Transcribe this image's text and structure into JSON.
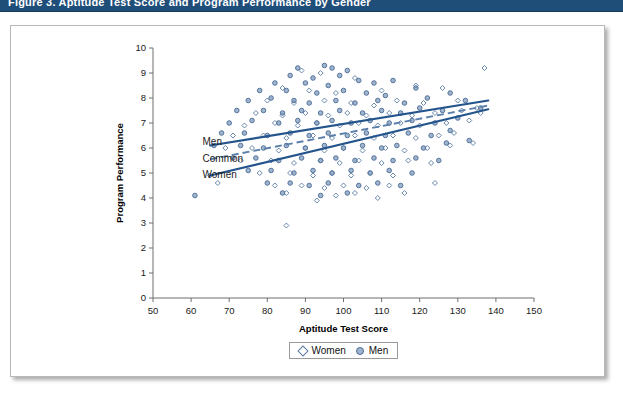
{
  "banner": {
    "title": "Figure 3. Aptitude Test Score and Program Performance by Gender"
  },
  "chart_data": {
    "type": "scatter",
    "title": "",
    "xlabel": "Aptitude Test Score",
    "ylabel": "Program Performance",
    "xlim": [
      50,
      150
    ],
    "ylim": [
      0,
      10
    ],
    "xticks": [
      50,
      60,
      70,
      80,
      90,
      100,
      110,
      120,
      130,
      140,
      150
    ],
    "yticks": [
      0,
      1,
      2,
      3,
      4,
      5,
      6,
      7,
      8,
      9,
      10
    ],
    "grid": false,
    "legend_position": "bottom-center",
    "legend": [
      "Women",
      "Men"
    ],
    "annotations": [
      {
        "text": "Men",
        "x": 63,
        "y": 6.25
      },
      {
        "text": "Common",
        "x": 63,
        "y": 5.6
      },
      {
        "text": "Women",
        "x": 63,
        "y": 4.95
      }
    ],
    "trendlines": [
      {
        "name": "Men",
        "style": "solid",
        "x": [
          65,
          138
        ],
        "y": [
          6.1,
          7.9
        ]
      },
      {
        "name": "Common",
        "style": "dashed",
        "x": [
          65,
          138
        ],
        "y": [
          5.55,
          7.7
        ]
      },
      {
        "name": "Women",
        "style": "solid",
        "x": [
          65,
          138
        ],
        "y": [
          4.9,
          7.55
        ]
      }
    ],
    "series": [
      {
        "name": "Men",
        "marker": "filled-circle",
        "color": "#4a6a95",
        "points": [
          [
            88,
            9.2
          ],
          [
            95,
            9.3
          ],
          [
            97,
            9.2
          ],
          [
            101,
            9.1
          ],
          [
            86,
            8.9
          ],
          [
            92,
            8.8
          ],
          [
            99,
            8.9
          ],
          [
            104,
            8.7
          ],
          [
            82,
            8.6
          ],
          [
            90,
            8.6
          ],
          [
            96,
            8.5
          ],
          [
            108,
            8.6
          ],
          [
            113,
            8.7
          ],
          [
            78,
            8.3
          ],
          [
            85,
            8.3
          ],
          [
            93,
            8.2
          ],
          [
            100,
            8.3
          ],
          [
            106,
            8.2
          ],
          [
            111,
            8.1
          ],
          [
            119,
            8.4
          ],
          [
            75,
            7.9
          ],
          [
            81,
            8.0
          ],
          [
            87,
            7.9
          ],
          [
            91,
            7.8
          ],
          [
            98,
            7.9
          ],
          [
            103,
            7.8
          ],
          [
            109,
            7.9
          ],
          [
            116,
            7.8
          ],
          [
            122,
            8.0
          ],
          [
            72,
            7.5
          ],
          [
            79,
            7.5
          ],
          [
            84,
            7.4
          ],
          [
            89,
            7.5
          ],
          [
            94,
            7.4
          ],
          [
            99,
            7.5
          ],
          [
            105,
            7.4
          ],
          [
            110,
            7.5
          ],
          [
            115,
            7.4
          ],
          [
            120,
            7.6
          ],
          [
            126,
            7.5
          ],
          [
            70,
            7.0
          ],
          [
            76,
            7.1
          ],
          [
            83,
            7.0
          ],
          [
            88,
            7.1
          ],
          [
            93,
            7.0
          ],
          [
            97,
            7.1
          ],
          [
            102,
            7.0
          ],
          [
            107,
            7.1
          ],
          [
            112,
            7.0
          ],
          [
            118,
            7.1
          ],
          [
            124,
            7.0
          ],
          [
            130,
            7.2
          ],
          [
            68,
            6.6
          ],
          [
            74,
            6.6
          ],
          [
            80,
            6.5
          ],
          [
            86,
            6.6
          ],
          [
            91,
            6.5
          ],
          [
            96,
            6.6
          ],
          [
            101,
            6.5
          ],
          [
            106,
            6.6
          ],
          [
            111,
            6.5
          ],
          [
            117,
            6.6
          ],
          [
            123,
            6.5
          ],
          [
            128,
            6.7
          ],
          [
            66,
            6.1
          ],
          [
            73,
            6.1
          ],
          [
            79,
            6.0
          ],
          [
            85,
            6.1
          ],
          [
            90,
            6.0
          ],
          [
            95,
            6.1
          ],
          [
            100,
            6.0
          ],
          [
            105,
            6.1
          ],
          [
            110,
            6.0
          ],
          [
            114,
            6.1
          ],
          [
            121,
            6.0
          ],
          [
            127,
            6.2
          ],
          [
            133,
            6.3
          ],
          [
            71,
            5.6
          ],
          [
            77,
            5.6
          ],
          [
            83,
            5.5
          ],
          [
            89,
            5.6
          ],
          [
            94,
            5.5
          ],
          [
            98,
            5.6
          ],
          [
            103,
            5.5
          ],
          [
            108,
            5.6
          ],
          [
            113,
            5.5
          ],
          [
            119,
            5.6
          ],
          [
            125,
            5.5
          ],
          [
            75,
            5.1
          ],
          [
            81,
            5.1
          ],
          [
            87,
            5.0
          ],
          [
            92,
            5.1
          ],
          [
            97,
            5.0
          ],
          [
            102,
            5.1
          ],
          [
            107,
            5.0
          ],
          [
            112,
            5.1
          ],
          [
            118,
            5.0
          ],
          [
            80,
            4.6
          ],
          [
            86,
            4.6
          ],
          [
            91,
            4.5
          ],
          [
            96,
            4.6
          ],
          [
            104,
            4.5
          ],
          [
            109,
            4.6
          ],
          [
            115,
            4.5
          ],
          [
            84,
            4.2
          ],
          [
            94,
            4.1
          ],
          [
            101,
            4.2
          ],
          [
            61,
            4.1
          ],
          [
            132,
            7.9
          ],
          [
            136,
            7.6
          ],
          [
            128,
            8.2
          ]
        ]
      },
      {
        "name": "Women",
        "marker": "open-diamond",
        "color": "#5a7aa3",
        "points": [
          [
            89,
            9.1
          ],
          [
            94,
            9.0
          ],
          [
            103,
            8.8
          ],
          [
            119,
            8.5
          ],
          [
            84,
            8.4
          ],
          [
            91,
            8.3
          ],
          [
            98,
            8.2
          ],
          [
            110,
            8.3
          ],
          [
            126,
            8.4
          ],
          [
            137,
            9.2
          ],
          [
            80,
            7.9
          ],
          [
            87,
            7.8
          ],
          [
            95,
            7.9
          ],
          [
            102,
            7.8
          ],
          [
            108,
            7.7
          ],
          [
            114,
            7.9
          ],
          [
            121,
            7.8
          ],
          [
            130,
            7.9
          ],
          [
            135,
            7.6
          ],
          [
            77,
            7.4
          ],
          [
            84,
            7.3
          ],
          [
            90,
            7.4
          ],
          [
            96,
            7.3
          ],
          [
            101,
            7.4
          ],
          [
            106,
            7.3
          ],
          [
            112,
            7.4
          ],
          [
            118,
            7.3
          ],
          [
            124,
            7.4
          ],
          [
            131,
            7.5
          ],
          [
            136,
            7.4
          ],
          [
            74,
            6.9
          ],
          [
            82,
            7.0
          ],
          [
            88,
            6.9
          ],
          [
            93,
            7.0
          ],
          [
            99,
            6.9
          ],
          [
            104,
            7.0
          ],
          [
            109,
            6.9
          ],
          [
            115,
            7.0
          ],
          [
            120,
            6.9
          ],
          [
            127,
            7.0
          ],
          [
            133,
            7.1
          ],
          [
            71,
            6.5
          ],
          [
            79,
            6.5
          ],
          [
            85,
            6.4
          ],
          [
            92,
            6.5
          ],
          [
            97,
            6.4
          ],
          [
            103,
            6.5
          ],
          [
            108,
            6.4
          ],
          [
            113,
            6.5
          ],
          [
            119,
            6.4
          ],
          [
            125,
            6.5
          ],
          [
            129,
            6.6
          ],
          [
            69,
            6.0
          ],
          [
            76,
            6.0
          ],
          [
            83,
            5.9
          ],
          [
            90,
            6.0
          ],
          [
            95,
            5.9
          ],
          [
            100,
            6.0
          ],
          [
            105,
            5.9
          ],
          [
            111,
            6.0
          ],
          [
            116,
            5.9
          ],
          [
            122,
            6.0
          ],
          [
            128,
            6.1
          ],
          [
            134,
            6.2
          ],
          [
            73,
            5.5
          ],
          [
            81,
            5.5
          ],
          [
            87,
            5.4
          ],
          [
            94,
            5.5
          ],
          [
            99,
            5.4
          ],
          [
            104,
            5.5
          ],
          [
            110,
            5.4
          ],
          [
            117,
            5.5
          ],
          [
            123,
            5.4
          ],
          [
            78,
            5.0
          ],
          [
            86,
            5.0
          ],
          [
            92,
            4.9
          ],
          [
            97,
            5.0
          ],
          [
            102,
            4.9
          ],
          [
            107,
            5.0
          ],
          [
            113,
            4.9
          ],
          [
            82,
            4.5
          ],
          [
            89,
            4.5
          ],
          [
            95,
            4.4
          ],
          [
            100,
            4.5
          ],
          [
            106,
            4.4
          ],
          [
            112,
            4.5
          ],
          [
            85,
            4.2
          ],
          [
            98,
            4.1
          ],
          [
            103,
            4.2
          ],
          [
            109,
            4.0
          ],
          [
            65,
            4.9
          ],
          [
            67,
            4.6
          ],
          [
            85,
            2.9
          ],
          [
            93,
            3.9
          ],
          [
            116,
            4.2
          ],
          [
            124,
            4.6
          ]
        ]
      }
    ]
  }
}
